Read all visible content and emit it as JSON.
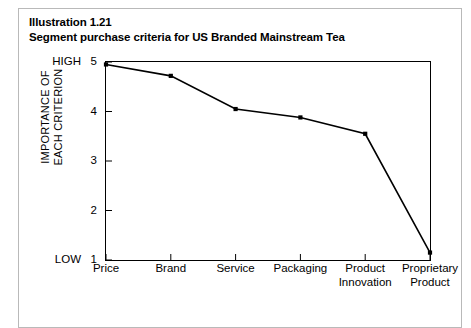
{
  "figure": {
    "title_line1": "Illustration 1.21",
    "title_line2": "Segment purchase criteria for US Branded Mainstream Tea"
  },
  "axis": {
    "y_title_line1": "IMPORTANCE OF",
    "y_title_line2": "EACH CRITERION",
    "y_high_label": "HIGH",
    "y_low_label": "LOW",
    "y_tick_5": "5",
    "y_tick_4": "4",
    "y_tick_3": "3",
    "y_tick_2": "2",
    "y_tick_1": "1"
  },
  "chart_data": {
    "type": "line",
    "title": "Segment purchase criteria for US Branded Mainstream Tea",
    "xlabel": "",
    "ylabel": "IMPORTANCE OF EACH CRITERION",
    "ylim": [
      1,
      5
    ],
    "yticks": [
      1,
      2,
      3,
      4,
      5
    ],
    "ytick_labels": [
      "1",
      "2",
      "3",
      "4",
      "5"
    ],
    "y_axis_endpoint_labels": {
      "low": "LOW",
      "high": "HIGH"
    },
    "grid": false,
    "legend": null,
    "marker": "square",
    "line_color": "#000000",
    "categories": [
      "Price",
      "Brand",
      "Service",
      "Packaging",
      "Product Innovation",
      "Proprietary Product"
    ],
    "category_lines": [
      [
        "Price"
      ],
      [
        "Brand"
      ],
      [
        "Service"
      ],
      [
        "Packaging"
      ],
      [
        "Product",
        "Innovation"
      ],
      [
        "Proprietary",
        "Product"
      ]
    ],
    "values": [
      4.95,
      4.72,
      4.05,
      3.88,
      3.55,
      1.15
    ]
  }
}
